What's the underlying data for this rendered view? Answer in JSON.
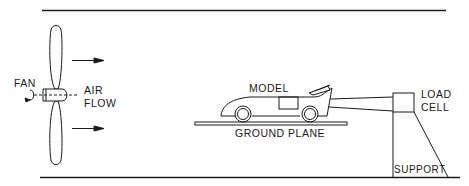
{
  "diagram": {
    "type": "wind tunnel test setup",
    "labels": {
      "fan": "FAN",
      "air_flow_line1": "AIR",
      "air_flow_line2": "FLOW",
      "model": "MODEL",
      "ground_plane": "GROUND PLANE",
      "load_cell_line1": "LOAD",
      "load_cell_line2": "CELL",
      "support": "SUPPORT"
    },
    "colors": {
      "stroke": "#1a1a1a",
      "background": "#ffffff"
    }
  }
}
